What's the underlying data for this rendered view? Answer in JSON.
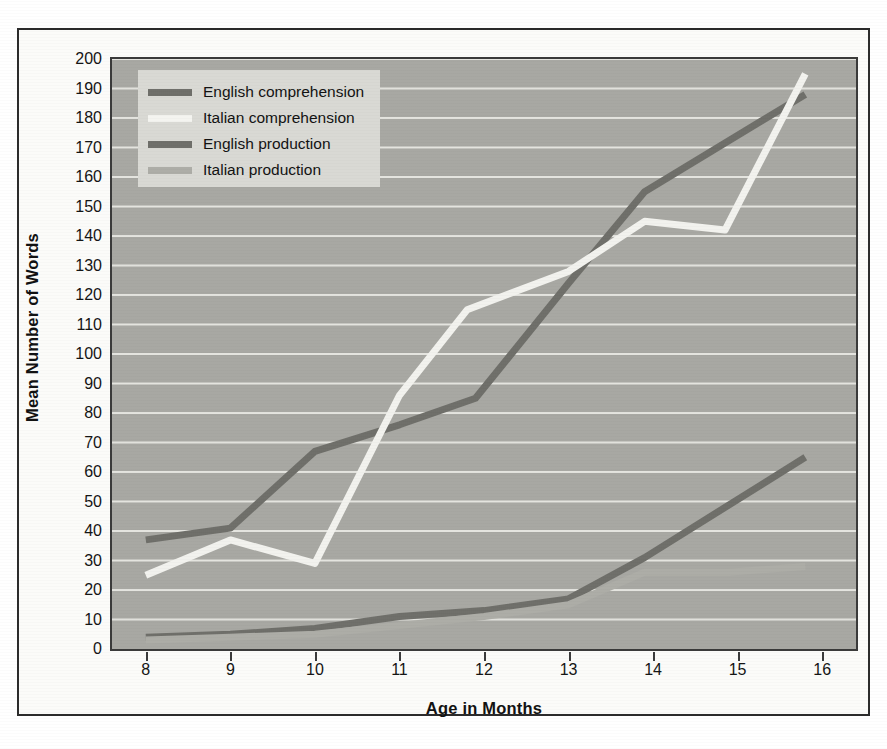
{
  "chart_data": {
    "type": "line",
    "title": "",
    "xlabel": "Age in Months",
    "ylabel": "Mean Number of Words",
    "xlim": [
      7.6,
      16.4
    ],
    "ylim": [
      0,
      200
    ],
    "xticks": [
      8,
      9,
      10,
      11,
      12,
      13,
      14,
      15,
      16
    ],
    "yticks": [
      0,
      10,
      20,
      30,
      40,
      50,
      60,
      70,
      80,
      90,
      100,
      110,
      120,
      130,
      140,
      150,
      160,
      170,
      180,
      190,
      200
    ],
    "grid": "horizontal",
    "legend_position": "top-left",
    "series": [
      {
        "name": "English comprehension",
        "color": "#6f6f6a",
        "x": [
          8,
          9,
          10,
          11,
          11.9,
          13,
          13.9,
          15.8
        ],
        "values": [
          37,
          41,
          67,
          76,
          85,
          124,
          155,
          188
        ]
      },
      {
        "name": "Italian comprehension",
        "color": "#f2f2ee",
        "x": [
          8,
          9,
          10,
          11,
          11.8,
          13,
          13.9,
          14.85,
          15.8
        ],
        "values": [
          25,
          37,
          29,
          86,
          115,
          128,
          145,
          142,
          195
        ]
      },
      {
        "name": "English production",
        "color": "#6f6f6a",
        "x": [
          8,
          9,
          10,
          11,
          12,
          13,
          13.9,
          15.8
        ],
        "values": [
          4,
          5,
          7,
          11,
          13,
          17,
          31,
          65
        ]
      },
      {
        "name": "Italian production",
        "color": "#adada7",
        "x": [
          8,
          9,
          10,
          11,
          12,
          13,
          13.9,
          14.9,
          15.8
        ],
        "values": [
          3,
          4,
          5,
          8,
          11,
          15,
          26,
          26,
          28
        ]
      }
    ]
  },
  "legend": {
    "items": [
      {
        "label": "English comprehension",
        "color": "#6f6f6a"
      },
      {
        "label": "Italian comprehension",
        "color": "#f4f4f0"
      },
      {
        "label": "English production",
        "color": "#6f6f6a"
      },
      {
        "label": "Italian production",
        "color": "#adada7"
      }
    ]
  },
  "axes": {
    "x_title": "Age in Months",
    "y_title": "Mean Number of Words",
    "x_ticks": [
      "8",
      "9",
      "10",
      "11",
      "12",
      "13",
      "14",
      "15",
      "16"
    ],
    "y_ticks": [
      "200",
      "190",
      "180",
      "170",
      "160",
      "150",
      "140",
      "130",
      "120",
      "110",
      "100",
      "90",
      "80",
      "70",
      "60",
      "50",
      "40",
      "30",
      "20",
      "10",
      "0"
    ]
  },
  "colors": {
    "plot_background": "#a8a8a3",
    "gridline": "#e4e4df",
    "axis_line": "#3a3a3a",
    "page_background": "#ffffff",
    "frame": "#2b2b2b",
    "legend_background": "#d9d9d4"
  }
}
